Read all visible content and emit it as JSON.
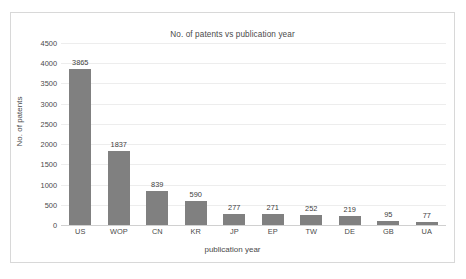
{
  "chart_data": {
    "type": "bar",
    "title": "No. of patents vs publication year",
    "xlabel": "publication year",
    "ylabel": "No. of patents",
    "categories": [
      "US",
      "WOP",
      "CN",
      "KR",
      "JP",
      "EP",
      "TW",
      "DE",
      "GB",
      "UA"
    ],
    "values": [
      3865,
      1837,
      839,
      590,
      277,
      271,
      252,
      219,
      95,
      77
    ],
    "value_labels": [
      "3865",
      "1837",
      "839",
      "590",
      "277",
      "271",
      "252",
      "219",
      "95",
      "77"
    ],
    "ylim": [
      0,
      4500
    ],
    "ytick_labels": [
      "4500",
      "4000",
      "3500",
      "3000",
      "2500",
      "2000",
      "1500",
      "1000",
      "500",
      "0"
    ],
    "ytick_values": [
      4500,
      4000,
      3500,
      3000,
      2500,
      2000,
      1500,
      1000,
      500,
      0
    ],
    "grid": true,
    "legend": false,
    "bar_color": "#808080",
    "gridline_color": "#ededed",
    "axis_color": "#d0d0d0",
    "text_color": "#4a4a4a",
    "frame_color": "#d8d8d8",
    "background": "#ffffff"
  }
}
